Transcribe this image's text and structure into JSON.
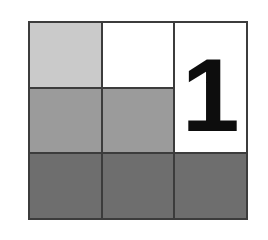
{
  "figure": {
    "background_color": "#ffffff",
    "grid_line_color": "#3c3c3c",
    "shade_colors": {
      "light": "#cacaca",
      "medium": "#9b9b9b",
      "dark": "#6e6e6e",
      "white": "#ffffff"
    },
    "cells": [
      {
        "id": "top-left",
        "row": 1,
        "col": 1,
        "row_span": 1,
        "color": "#cacaca",
        "label": ""
      },
      {
        "id": "top-middle",
        "row": 1,
        "col": 2,
        "row_span": 1,
        "color": "#ffffff",
        "label": ""
      },
      {
        "id": "right-merged",
        "row": 1,
        "col": 3,
        "row_span": 2,
        "color": "#ffffff",
        "label": "1"
      },
      {
        "id": "middle-left",
        "row": 2,
        "col": 1,
        "row_span": 1,
        "color": "#9b9b9b",
        "label": ""
      },
      {
        "id": "middle-middle",
        "row": 2,
        "col": 2,
        "row_span": 1,
        "color": "#9b9b9b",
        "label": ""
      },
      {
        "id": "bottom-left",
        "row": 3,
        "col": 1,
        "row_span": 1,
        "color": "#6e6e6e",
        "label": ""
      },
      {
        "id": "bottom-middle",
        "row": 3,
        "col": 2,
        "row_span": 1,
        "color": "#6e6e6e",
        "label": ""
      },
      {
        "id": "bottom-right",
        "row": 3,
        "col": 3,
        "row_span": 1,
        "color": "#6e6e6e",
        "label": ""
      }
    ],
    "number_label": "1",
    "number_color": "#0d0d0d"
  }
}
